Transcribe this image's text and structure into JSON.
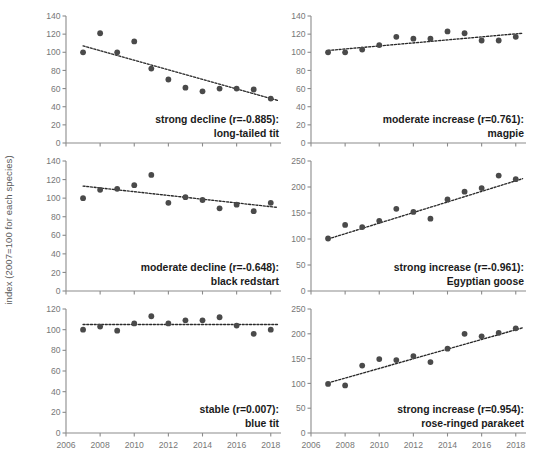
{
  "figure": {
    "ylabel": "index (2007=100 for each species)",
    "point_color": "#4a4a4a",
    "trend_color": "#2a2a2a",
    "axis_color": "#8b8b8b"
  },
  "chart_data": [
    {
      "type": "scatter",
      "title": "long-tailed tit",
      "annotation_line1": "strong decline (r=-0.885):",
      "annotation_line2": "long-tailed tit",
      "correlation": -0.885,
      "trend_label": "strong decline",
      "xlabel": "",
      "ylabel": "index (2007=100 for each species)",
      "xlim": [
        2006,
        2018.6
      ],
      "ylim": [
        0,
        140
      ],
      "xticks": [
        2006,
        2008,
        2010,
        2012,
        2014,
        2016,
        2018
      ],
      "xticklabels": [
        "2006",
        "2008",
        "2010",
        "2012",
        "2014",
        "2016",
        "2018"
      ],
      "yticks": [
        0,
        20,
        40,
        60,
        80,
        100,
        120,
        140
      ],
      "yticklabels": [
        "0",
        "20",
        "40",
        "60",
        "80",
        "100",
        "120",
        "140"
      ],
      "grid": false,
      "legend": "none",
      "x": [
        2007,
        2008,
        2009,
        2010,
        2011,
        2012,
        2013,
        2014,
        2015,
        2016,
        2017,
        2018
      ],
      "values": [
        100,
        121,
        100,
        112,
        82,
        70,
        61,
        57,
        60,
        60,
        59,
        49
      ],
      "trendline": {
        "x": [
          2007,
          2018.4
        ],
        "y": [
          107,
          47
        ]
      }
    },
    {
      "type": "scatter",
      "title": "magpie",
      "annotation_line1": "moderate increase (r=0.761):",
      "annotation_line2": "magpie",
      "correlation": 0.761,
      "trend_label": "moderate increase",
      "xlabel": "",
      "ylabel": "index (2007=100 for each species)",
      "xlim": [
        2006,
        2018.6
      ],
      "ylim": [
        0,
        140
      ],
      "xticks": [
        2006,
        2008,
        2010,
        2012,
        2014,
        2016,
        2018
      ],
      "xticklabels": [
        "2006",
        "2008",
        "2010",
        "2012",
        "2014",
        "2016",
        "2018"
      ],
      "yticks": [
        0,
        20,
        40,
        60,
        80,
        100,
        120,
        140
      ],
      "yticklabels": [
        "0",
        "20",
        "40",
        "60",
        "80",
        "100",
        "120",
        "140"
      ],
      "grid": false,
      "legend": "none",
      "x": [
        2007,
        2008,
        2009,
        2010,
        2011,
        2012,
        2013,
        2014,
        2015,
        2016,
        2017,
        2018
      ],
      "values": [
        100,
        100,
        103,
        108,
        117,
        115,
        115,
        123,
        121,
        113,
        113,
        117
      ],
      "trendline": {
        "x": [
          2007,
          2018.4
        ],
        "y": [
          102,
          121
        ]
      }
    },
    {
      "type": "scatter",
      "title": "black redstart",
      "annotation_line1": "moderate decline (r=-0.648):",
      "annotation_line2": "black redstart",
      "correlation": -0.648,
      "trend_label": "moderate decline",
      "xlabel": "",
      "ylabel": "index (2007=100 for each species)",
      "xlim": [
        2006,
        2018.6
      ],
      "ylim": [
        0,
        140
      ],
      "xticks": [
        2006,
        2008,
        2010,
        2012,
        2014,
        2016,
        2018
      ],
      "xticklabels": [
        "2006",
        "2008",
        "2010",
        "2012",
        "2014",
        "2016",
        "2018"
      ],
      "yticks": [
        0,
        20,
        40,
        60,
        80,
        100,
        120,
        140
      ],
      "yticklabels": [
        "0",
        "20",
        "40",
        "60",
        "80",
        "100",
        "120",
        "140"
      ],
      "grid": false,
      "legend": "none",
      "x": [
        2007,
        2008,
        2009,
        2010,
        2011,
        2012,
        2013,
        2014,
        2015,
        2016,
        2017,
        2018
      ],
      "values": [
        100,
        109,
        110,
        114,
        125,
        95,
        101,
        98,
        89,
        93,
        86,
        95
      ],
      "trendline": {
        "x": [
          2007,
          2018.4
        ],
        "y": [
          113,
          90
        ]
      }
    },
    {
      "type": "scatter",
      "title": "Egyptian goose",
      "annotation_line1": "strong increase (r=-0.961):",
      "annotation_line2": "Egyptian goose",
      "correlation": -0.961,
      "trend_label": "strong increase",
      "xlabel": "",
      "ylabel": "index (2007=100 for each species)",
      "xlim": [
        2006,
        2018.6
      ],
      "ylim": [
        0,
        250
      ],
      "xticks": [
        2006,
        2008,
        2010,
        2012,
        2014,
        2016,
        2018
      ],
      "xticklabels": [
        "2006",
        "2008",
        "2010",
        "2012",
        "2014",
        "2016",
        "2018"
      ],
      "yticks": [
        0,
        50,
        100,
        150,
        200,
        250
      ],
      "yticklabels": [
        "0",
        "50",
        "100",
        "150",
        "200",
        "250"
      ],
      "grid": false,
      "legend": "none",
      "x": [
        2007,
        2008,
        2009,
        2010,
        2011,
        2012,
        2013,
        2014,
        2015,
        2016,
        2017,
        2018
      ],
      "values": [
        101,
        127,
        123,
        135,
        158,
        152,
        139,
        176,
        191,
        198,
        222,
        215
      ],
      "trendline": {
        "x": [
          2007,
          2018.4
        ],
        "y": [
          100,
          216
        ]
      }
    },
    {
      "type": "scatter",
      "title": "blue tit",
      "annotation_line1": "stable (r=0.007):",
      "annotation_line2": "blue tit",
      "correlation": 0.007,
      "trend_label": "stable",
      "xlabel": "",
      "ylabel": "index (2007=100 for each species)",
      "xlim": [
        2006,
        2018.6
      ],
      "ylim": [
        0,
        120
      ],
      "xticks": [
        2006,
        2008,
        2010,
        2012,
        2014,
        2016,
        2018
      ],
      "xticklabels": [
        "2006",
        "2008",
        "2010",
        "2012",
        "2014",
        "2016",
        "2018"
      ],
      "yticks": [
        0,
        20,
        40,
        60,
        80,
        100,
        120
      ],
      "yticklabels": [
        "0",
        "20",
        "40",
        "60",
        "80",
        "100",
        "120"
      ],
      "grid": false,
      "legend": "none",
      "x": [
        2007,
        2008,
        2009,
        2010,
        2011,
        2012,
        2013,
        2014,
        2015,
        2016,
        2017,
        2018
      ],
      "values": [
        100,
        103,
        99,
        106,
        113,
        106,
        109,
        109,
        112,
        104,
        96,
        100
      ],
      "trendline": {
        "x": [
          2007,
          2018.4
        ],
        "y": [
          105,
          105
        ]
      }
    },
    {
      "type": "scatter",
      "title": "rose-ringed parakeet",
      "annotation_line1": "strong increase (r=0.954):",
      "annotation_line2": "rose-ringed parakeet",
      "correlation": 0.954,
      "trend_label": "strong increase",
      "xlabel": "",
      "ylabel": "index (2007=100 for each species)",
      "xlim": [
        2006,
        2018.6
      ],
      "ylim": [
        0,
        250
      ],
      "xticks": [
        2006,
        2008,
        2010,
        2012,
        2014,
        2016,
        2018
      ],
      "xticklabels": [
        "2006",
        "2008",
        "2010",
        "2012",
        "2014",
        "2016",
        "2018"
      ],
      "yticks": [
        0,
        50,
        100,
        150,
        200,
        250
      ],
      "yticklabels": [
        "0",
        "50",
        "100",
        "150",
        "200",
        "250"
      ],
      "grid": false,
      "legend": "none",
      "x": [
        2007,
        2008,
        2009,
        2010,
        2011,
        2012,
        2013,
        2014,
        2015,
        2016,
        2017,
        2018
      ],
      "values": [
        99,
        96,
        136,
        149,
        147,
        155,
        143,
        170,
        200,
        195,
        202,
        211
      ],
      "trendline": {
        "x": [
          2007,
          2018.4
        ],
        "y": [
          101,
          212
        ]
      }
    }
  ],
  "panels": [
    {
      "id": "long-tailed-tit",
      "show_xaxis_labels": false
    },
    {
      "id": "magpie",
      "show_xaxis_labels": false
    },
    {
      "id": "black-redstart",
      "show_xaxis_labels": false
    },
    {
      "id": "egyptian-goose",
      "show_xaxis_labels": false
    },
    {
      "id": "blue-tit",
      "show_xaxis_labels": true
    },
    {
      "id": "rose-ringed-parakeet",
      "show_xaxis_labels": true
    }
  ]
}
